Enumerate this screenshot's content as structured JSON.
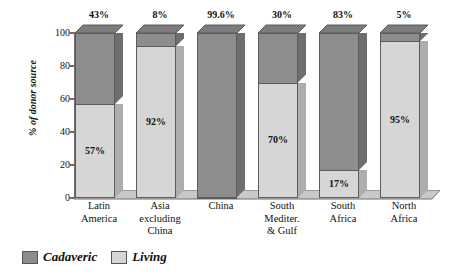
{
  "chart_data": {
    "type": "bar",
    "subtype": "stacked-100-percent-3d",
    "title": "",
    "xlabel": "",
    "ylabel": "% of donor source",
    "ylim": [
      0,
      100
    ],
    "yticks": [
      0,
      20,
      40,
      60,
      80,
      100
    ],
    "ytick_labels": [
      "0",
      "20",
      "40",
      "60",
      "80",
      "100"
    ],
    "grid": false,
    "legend_position": "bottom-left",
    "categories": [
      "Latin America",
      "Asia excluding China",
      "China",
      "South Mediter. & Gulf",
      "South Africa",
      "North Africa"
    ],
    "category_lines": [
      [
        "Latin",
        "America"
      ],
      [
        "Asia",
        "excluding",
        "China"
      ],
      [
        "China"
      ],
      [
        "South",
        "Mediter.",
        "& Gulf"
      ],
      [
        "South",
        "Africa"
      ],
      [
        "North",
        "Africa"
      ]
    ],
    "series": [
      {
        "name": "Cadaveric",
        "color": "#8d8d8d",
        "values": [
          43,
          8,
          99.6,
          30,
          83,
          5
        ],
        "labels": [
          "43%",
          "8%",
          "99.6%",
          "30%",
          "83%",
          "5%"
        ],
        "label_position": "above-bar"
      },
      {
        "name": "Living",
        "color": "#d6d6d6",
        "values": [
          57,
          92,
          0.4,
          70,
          17,
          95
        ],
        "labels": [
          "57%",
          "92%",
          "",
          "70%",
          "17%",
          "95%"
        ],
        "label_position": "inside-segment"
      }
    ]
  },
  "axis": {
    "y_label": "% of donor source",
    "y_ticks": [
      "100",
      "80",
      "60",
      "40",
      "20",
      "0"
    ]
  },
  "bars": [
    {
      "category": "Latin America",
      "lines": [
        "Latin",
        "America"
      ],
      "cadaveric_pct": 43,
      "living_pct": 57,
      "top_label": "43%",
      "inner_label": "57%"
    },
    {
      "category": "Asia excluding China",
      "lines": [
        "Asia",
        "excluding",
        "China"
      ],
      "cadaveric_pct": 8,
      "living_pct": 92,
      "top_label": "8%",
      "inner_label": "92%"
    },
    {
      "category": "China",
      "lines": [
        "China"
      ],
      "cadaveric_pct": 99.6,
      "living_pct": 0.4,
      "top_label": "99.6%",
      "inner_label": ""
    },
    {
      "category": "South Mediter. & Gulf",
      "lines": [
        "South",
        "Mediter.",
        "& Gulf"
      ],
      "cadaveric_pct": 30,
      "living_pct": 70,
      "top_label": "30%",
      "inner_label": "70%"
    },
    {
      "category": "South Africa",
      "lines": [
        "South",
        "Africa"
      ],
      "cadaveric_pct": 83,
      "living_pct": 17,
      "top_label": "83%",
      "inner_label": "17%"
    },
    {
      "category": "North Africa",
      "lines": [
        "North",
        "Africa"
      ],
      "cadaveric_pct": 5,
      "living_pct": 95,
      "top_label": "5%",
      "inner_label": "95%"
    }
  ],
  "legend": {
    "items": [
      {
        "label": "Cadaveric",
        "color": "#8d8d8d",
        "swatch": "legend-swatch-cadaveric"
      },
      {
        "label": "Living",
        "color": "#d6d6d6",
        "swatch": "legend-swatch-living"
      }
    ]
  },
  "colors": {
    "cadaveric_front": "#8d8d8d",
    "cadaveric_side": "#6e6e6e",
    "cadaveric_top": "#7c7c7c",
    "living_front": "#d6d6d6",
    "living_side": "#adadad",
    "axis": "#6d6d6d",
    "background": "#ffffff",
    "text": "#111111"
  }
}
